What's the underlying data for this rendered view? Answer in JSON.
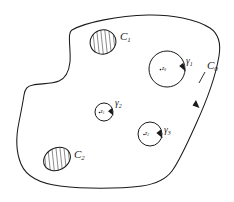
{
  "figure": {
    "kind": "complex-analysis-contour-diagram",
    "background_color": "#ffffff",
    "stroke_color": "#1a1a1a",
    "hatch_color": "#2b2b2b",
    "width": 234,
    "height": 202,
    "top_cut_text": "",
    "outer_boundary": {
      "name": "C0",
      "label": "C",
      "subscript": "0",
      "label_x": 207,
      "label_y": 66,
      "has_direction_arrow": true,
      "arrow_x": 195,
      "arrow_y": 103
    },
    "hatched_regions": [
      {
        "name": "C1",
        "label": "C",
        "subscript": "1",
        "cx": 103,
        "cy": 42,
        "rx": 13,
        "ry": 12,
        "rotation": -18,
        "label_x": 120,
        "label_y": 37
      },
      {
        "name": "C2",
        "label": "C",
        "subscript": "2",
        "cx": 57,
        "cy": 159,
        "rx": 14,
        "ry": 11,
        "rotation": -28,
        "label_x": 74,
        "label_y": 155
      }
    ],
    "contours": [
      {
        "name": "gamma1",
        "label": "γ",
        "subscript": "1",
        "cx": 167,
        "cy": 69,
        "r": 18,
        "label_x": 186,
        "label_y": 63,
        "point_label": "z",
        "point_subscript": "0",
        "point_x": 165,
        "point_y": 70,
        "arrow_angle_deg": 25
      },
      {
        "name": "gamma2",
        "label": "γ",
        "subscript": "2",
        "cx": 104,
        "cy": 112,
        "r": 9,
        "label_x": 116,
        "label_y": 105,
        "point_label": "z",
        "point_subscript": "1",
        "point_x": 102,
        "point_y": 113,
        "arrow_angle_deg": 35
      },
      {
        "name": "gamma3",
        "label": "γ",
        "subscript": "3",
        "cx": 150,
        "cy": 134,
        "r": 12,
        "label_x": 165,
        "label_y": 132,
        "point_label": "z",
        "point_subscript": "2",
        "point_x": 148,
        "point_y": 135,
        "arrow_angle_deg": 25
      }
    ]
  }
}
